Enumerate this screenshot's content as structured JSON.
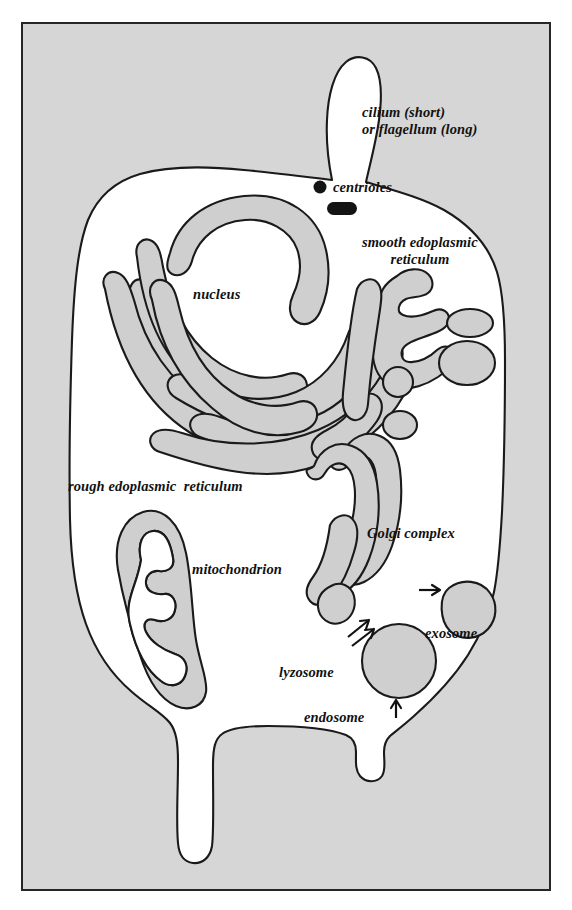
{
  "figure": {
    "type": "diagram",
    "frame": {
      "border_color": "#262626",
      "background_color": "#d6d6d6"
    },
    "cytoplasm_color": "#ffffff",
    "organelle_fill_color": "#cfcfcf",
    "stroke_color": "#1a1a1a"
  },
  "labels": {
    "cilium": "cilium (short)\nor flagellum (long)",
    "centrioles": "centrioles",
    "smooth_er": "smooth edoplasmic\nreticulum",
    "nucleus": "nucleus",
    "rough_er": "rough edoplasmic  reticulum",
    "golgi": "Golgi complex",
    "mitochondrion": "mitochondrion",
    "exosome": "exosome",
    "lyzosome": "lyzosome",
    "endosome": "endosome"
  },
  "glyphs": {
    "centriole_dot": "filled-circle",
    "centriole_bar": "filled-rounded-bar",
    "arrow_golgi_to_exosome": "arrow-right",
    "arrow_golgi_to_lyzosome": "arrow-down-left-pair",
    "arrow_endosome_to_lyzosome": "arrow-up"
  }
}
